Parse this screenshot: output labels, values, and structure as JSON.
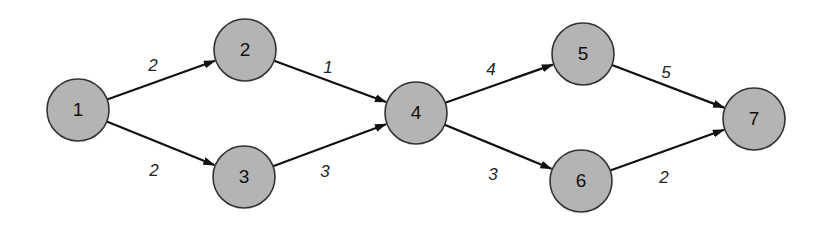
{
  "diagram": {
    "type": "directed-network",
    "node_fill": "#b4b4b4",
    "node_stroke": "#333333",
    "edge_color": "#111111",
    "nodes": [
      {
        "id": "1",
        "label": "1",
        "x": 78,
        "y": 110
      },
      {
        "id": "2",
        "label": "2",
        "x": 245,
        "y": 50
      },
      {
        "id": "3",
        "label": "3",
        "x": 244,
        "y": 177
      },
      {
        "id": "4",
        "label": "4",
        "x": 416,
        "y": 113
      },
      {
        "id": "5",
        "label": "5",
        "x": 583,
        "y": 54
      },
      {
        "id": "6",
        "label": "6",
        "x": 581,
        "y": 181
      },
      {
        "id": "7",
        "label": "7",
        "x": 754,
        "y": 119
      }
    ],
    "edges": [
      {
        "from": "1",
        "to": "2",
        "weight": "2",
        "lx": 153,
        "ly": 67
      },
      {
        "from": "1",
        "to": "3",
        "weight": "2",
        "lx": 154,
        "ly": 172
      },
      {
        "from": "2",
        "to": "4",
        "weight": "1",
        "lx": 328,
        "ly": 69
      },
      {
        "from": "3",
        "to": "4",
        "weight": "3",
        "lx": 325,
        "ly": 173
      },
      {
        "from": "4",
        "to": "5",
        "weight": "4",
        "lx": 491,
        "ly": 71
      },
      {
        "from": "4",
        "to": "6",
        "weight": "3",
        "lx": 493,
        "ly": 176
      },
      {
        "from": "5",
        "to": "7",
        "weight": "5",
        "lx": 666,
        "ly": 74
      },
      {
        "from": "6",
        "to": "7",
        "weight": "2",
        "lx": 664,
        "ly": 179
      }
    ]
  }
}
